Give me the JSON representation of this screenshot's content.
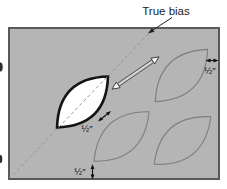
{
  "labels": {
    "true_bias": "True bias",
    "half_inch_seam": "½″",
    "half_inch_right": "½″",
    "half_inch_bottom": "½″"
  },
  "icons": {
    "bias_direction_arrow": "double-headed-arrow",
    "true_bias_pointer": "arrow-pointer",
    "measure_arrows": "double-headed-arrow"
  },
  "colors": {
    "page_background": "#ffffff",
    "fabric_fill": "#b5b5b5",
    "fabric_border": "#5a5a5a",
    "leaf_outline": "#7d7d7d",
    "cut_leaf_fill": "#ffffff",
    "cut_leaf_outline": "#141414",
    "bias_line": "#989898",
    "measure_arrow": "#111111",
    "text": "#1a1a1a"
  }
}
